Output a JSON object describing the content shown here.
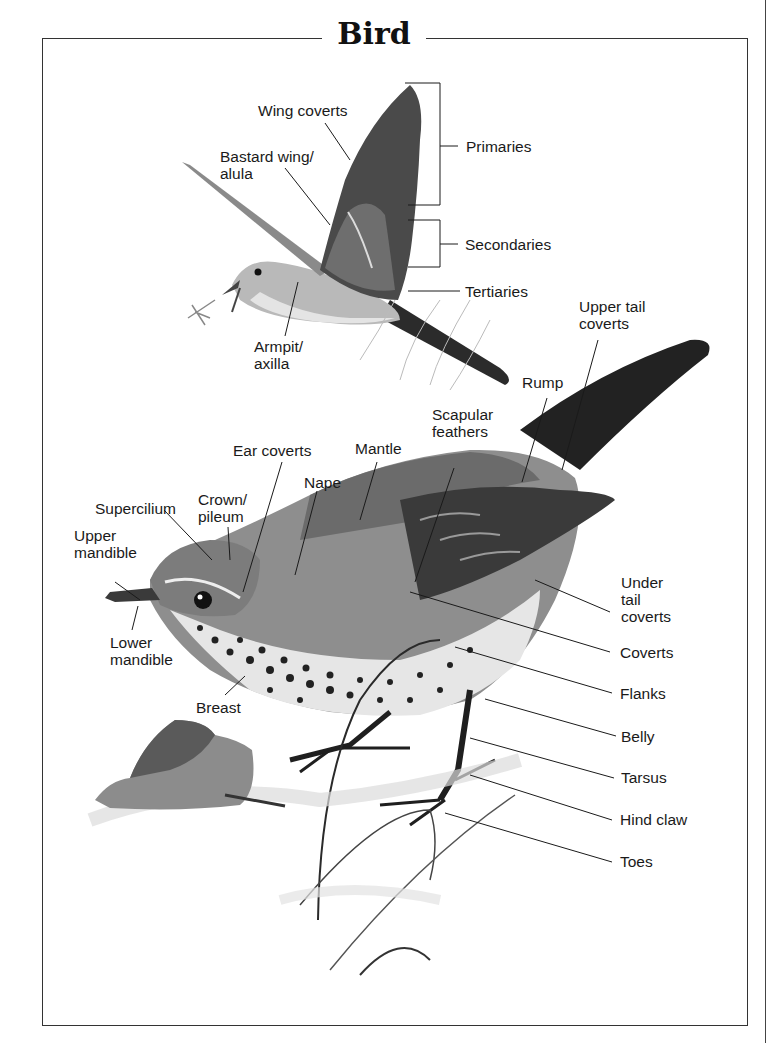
{
  "title": "Bird",
  "flying_bird_labels": {
    "wing_coverts": "Wing coverts",
    "bastard_wing": "Bastard wing/\nalula",
    "primaries": "Primaries",
    "secondaries": "Secondaries",
    "tertiaries": "Tertiaries",
    "armpit": "Armpit/\naxilla"
  },
  "perched_bird_labels": {
    "upper_tail_coverts": "Upper tail\ncoverts",
    "rump": "Rump",
    "scapular_feathers": "Scapular\nfeathers",
    "ear_coverts": "Ear coverts",
    "mantle": "Mantle",
    "nape": "Nape",
    "supercilium": "Supercilium",
    "crown": "Crown/\npileum",
    "upper_mandible": "Upper\nmandible",
    "lower_mandible": "Lower\nmandible",
    "breast": "Breast",
    "under_tail_coverts": "Under\ntail\ncoverts",
    "coverts": "Coverts",
    "flanks": "Flanks",
    "belly": "Belly",
    "tarsus": "Tarsus",
    "hind_claw": "Hind claw",
    "toes": "Toes"
  },
  "colors": {
    "ink": "#1a1a1a",
    "frame": "#333333",
    "bird_dark": "#2b2b2b",
    "bird_mid": "#7a7a7a",
    "bird_light": "#c8c8c8"
  }
}
